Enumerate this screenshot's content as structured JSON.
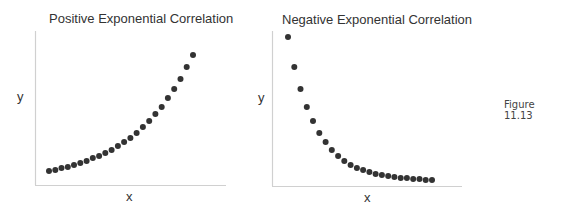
{
  "figure_label": "Figure 11.13",
  "chart_data": [
    {
      "type": "scatter",
      "title": "Positive Exponential Correlation",
      "xlabel": "x",
      "ylabel": "y",
      "grid": false,
      "ticks": false,
      "x": [
        1,
        2,
        3,
        4,
        5,
        6,
        7,
        8,
        9,
        10,
        11,
        12,
        13,
        14,
        15,
        16,
        17,
        18,
        19,
        20,
        21,
        22,
        23,
        24
      ],
      "y": [
        1.0,
        1.5,
        2.0,
        2.6,
        3.2,
        3.9,
        4.7,
        5.6,
        6.6,
        7.7,
        9.0,
        10.4,
        12.0,
        13.8,
        15.8,
        18.1,
        20.6,
        23.4,
        26.6,
        30.1,
        34.0,
        38.3,
        43.1,
        48.4
      ],
      "trend": "increasing-exponential",
      "px": {
        "x0": 49,
        "dx": 6.26,
        "y": [
          171,
          170,
          168,
          167,
          165,
          163,
          161,
          158,
          156,
          153,
          150,
          146,
          142,
          138,
          133,
          127,
          121,
          114,
          107,
          98,
          89,
          79,
          67,
          55
        ]
      },
      "point_color": "#333333",
      "axis_color": "#d0d0d0"
    },
    {
      "type": "scatter",
      "title": "Negative Exponential Correlation",
      "xlabel": "x",
      "ylabel": "y",
      "grid": false,
      "ticks": false,
      "x": [
        1,
        2,
        3,
        4,
        5,
        6,
        7,
        8,
        9,
        10,
        11,
        12,
        13,
        14,
        15,
        16,
        17,
        18,
        19,
        20,
        21,
        22,
        23,
        24
      ],
      "y": [
        48.0,
        37.0,
        28.5,
        22.0,
        17.0,
        13.2,
        10.3,
        8.1,
        6.5,
        5.2,
        4.3,
        3.6,
        3.1,
        2.7,
        2.4,
        2.2,
        2.0,
        1.9,
        1.8,
        1.7,
        1.6,
        1.6,
        1.5,
        1.5
      ],
      "trend": "decreasing-exponential",
      "px": {
        "x0": 288,
        "dx": 6.26,
        "y": [
          37,
          67,
          89,
          107,
          121,
          133,
          142,
          150,
          156,
          161,
          165,
          168,
          170,
          172,
          174,
          175,
          176,
          177,
          178,
          178,
          179,
          179,
          180,
          180
        ]
      },
      "point_color": "#333333",
      "axis_color": "#d0d0d0"
    }
  ]
}
